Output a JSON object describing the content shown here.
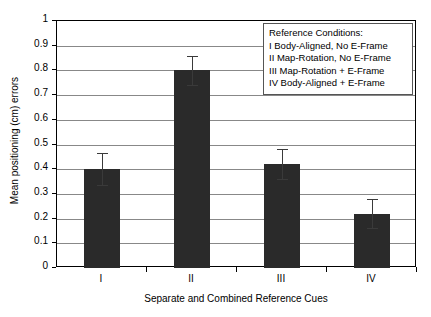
{
  "chart_data": {
    "type": "bar",
    "title": "",
    "xlabel": "Separate and Combined Reference Cues",
    "ylabel": "Mean positioning (cm) errors",
    "categories": [
      "I",
      "II",
      "III",
      "IV"
    ],
    "values": [
      0.4,
      0.8,
      0.42,
      0.22
    ],
    "errors": [
      0.065,
      0.06,
      0.06,
      0.06
    ],
    "error_low": [
      0.335,
      0.74,
      0.36,
      0.16
    ],
    "error_high": [
      0.465,
      0.86,
      0.48,
      0.28
    ],
    "ylim": [
      0,
      1
    ],
    "yticks": [
      "0",
      "0.1",
      "0.2",
      "0.3",
      "0.4",
      "0.5",
      "0.6",
      "0.7",
      "0.8",
      "0.9",
      "1"
    ],
    "ytick_values": [
      0,
      0.1,
      0.2,
      0.3,
      0.4,
      0.5,
      0.6,
      0.7,
      0.8,
      0.9,
      1
    ],
    "grid": true,
    "legend_position": "top-right",
    "bar_color": "#2a2a2a",
    "gridline_color": "#888888",
    "axis_color": "#000000"
  },
  "legend": {
    "title": "Reference Conditions:",
    "entries": [
      "I Body-Aligned, No E-Frame",
      "II Map-Rotation, No E-Frame",
      "III Map-Rotation + E-Frame",
      "IV Body-Aligned + E-Frame"
    ]
  }
}
